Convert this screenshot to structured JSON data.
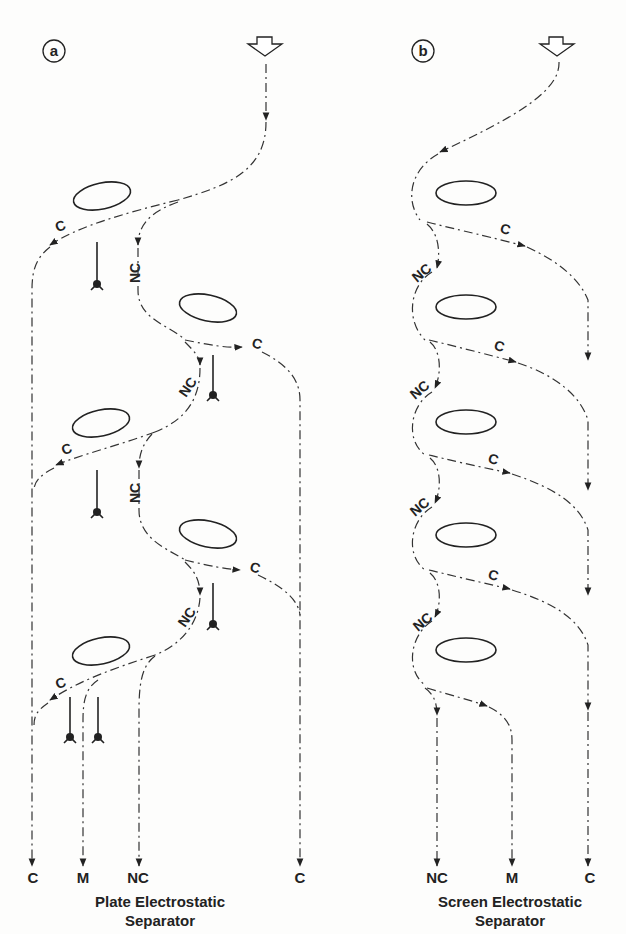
{
  "panel_a": {
    "badge": "a",
    "outputs": [
      "C",
      "M",
      "NC",
      "C"
    ],
    "caption_line1": "Plate Electrostatic",
    "caption_line2": "Separator",
    "stage_labels": {
      "c": "C",
      "nc": "NC"
    }
  },
  "panel_b": {
    "badge": "b",
    "outputs": [
      "NC",
      "M",
      "C"
    ],
    "caption_line1": "Screen Electrostatic",
    "caption_line2": "Separator",
    "stage_labels": {
      "c": "C",
      "nc": "NC"
    }
  },
  "icons": {
    "feed": "hollow-down-arrow-icon",
    "electrode": "ground-electrode-icon"
  }
}
